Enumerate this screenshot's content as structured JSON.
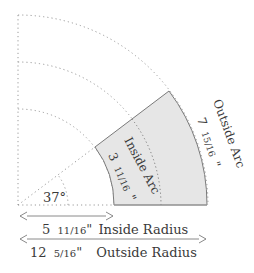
{
  "diagram": {
    "angle_label": "37°",
    "angle_degrees": 37,
    "inside_arc": {
      "title": "Inside Arc",
      "whole": "3",
      "fraction": "11/16",
      "unit": "\""
    },
    "outside_arc": {
      "title": "Outside Arc",
      "whole": "7",
      "fraction": "15/16",
      "unit": "\""
    },
    "inside_radius": {
      "whole": "5",
      "fraction": "11/16",
      "unit": "\"",
      "label": "Inside Radius"
    },
    "outside_radius": {
      "whole": "12",
      "fraction": "5/16",
      "unit": "\"",
      "label": "Outside Radius"
    },
    "colors": {
      "segment_fill": "#e6e6e6",
      "segment_stroke": "#7a7a7a",
      "dotted": "#9a9a9a",
      "arrow": "#8a8a8a",
      "text": "#3a3a3a"
    }
  }
}
